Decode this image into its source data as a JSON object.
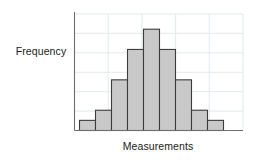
{
  "chart_data": {
    "type": "bar",
    "title": "",
    "subtitle": "",
    "xlabel": "Measurements",
    "ylabel": "Frequency",
    "categories": [
      "1",
      "2",
      "3",
      "4",
      "5",
      "6",
      "7",
      "8",
      "9"
    ],
    "values": [
      1,
      2,
      5,
      8,
      10,
      8,
      5,
      2,
      1
    ],
    "ylim": [
      0,
      11.5
    ],
    "grid": true,
    "grid_orientation": "both",
    "legend": false,
    "legend_position": "none",
    "tick_labels_x": [],
    "tick_labels_y": [],
    "annotations": [],
    "bar_fill": "#c9c9c9",
    "bar_edge": "#3c3c3c",
    "grid_color": "#dbe3e8",
    "axis_color": "#6e6e6e",
    "background": "#ffffff",
    "n_bars": 9,
    "shape": "symmetric bell-shaped / normal distribution"
  },
  "labels": {
    "ylabel": "Frequency",
    "xlabel": "Measurements"
  }
}
